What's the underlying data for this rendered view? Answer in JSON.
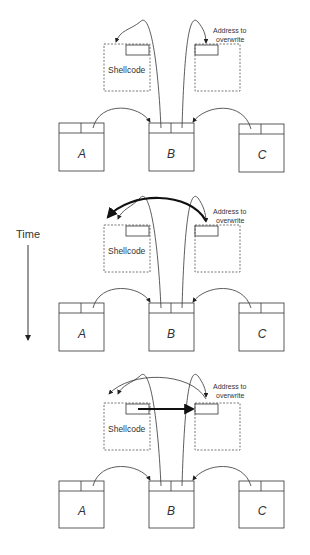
{
  "diagram": {
    "time_label": "Time",
    "panels": [
      {
        "id": "step-1",
        "shellcode_label": "Shellcode",
        "address_label_line1": "Address to",
        "address_label_line2": "overwrite",
        "nodes": [
          "A",
          "B",
          "C"
        ],
        "highlight": "none"
      },
      {
        "id": "step-2",
        "shellcode_label": "Shellcode",
        "address_label_line1": "Address to",
        "address_label_line2": "overwrite",
        "nodes": [
          "A",
          "B",
          "C"
        ],
        "highlight": "bold curved arrow from address-to-overwrite to shellcode"
      },
      {
        "id": "step-3",
        "shellcode_label": "Shellcode",
        "address_label_line1": "Address to",
        "address_label_line2": "overwrite",
        "nodes": [
          "A",
          "B",
          "C"
        ],
        "highlight": "bold straight arrow from shellcode pointer to address-to-overwrite"
      }
    ]
  }
}
